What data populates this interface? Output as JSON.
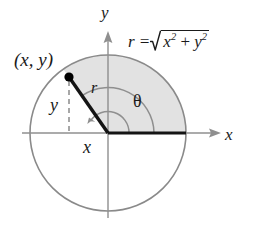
{
  "figure": {
    "labels": {
      "point": "(x, y)",
      "axis_y": "y",
      "axis_x": "x",
      "leg_vertical": "y",
      "leg_horizontal": "x",
      "radius": "r",
      "angle": "θ",
      "formula_lhs": "r =",
      "formula_term1": "x",
      "formula_exp1": "2",
      "formula_plus": "+",
      "formula_term2": "y",
      "formula_exp2": "2"
    },
    "colors": {
      "background": "#ffffff",
      "circle_stroke": "#8a8a8a",
      "axis_stroke": "#8f8f8f",
      "sector_fill": "#e2e2e2",
      "radius_line": "#141414",
      "dashed_line": "#8a8a8a",
      "point_fill": "#000000",
      "text": "#1a1a1a"
    },
    "geometry": {
      "center_x": 108,
      "center_y": 133,
      "circle_radius": 78,
      "point_x": 69,
      "point_y": 77,
      "angle_degrees": 125,
      "arc_small_radius": 21,
      "arc_large_radius": 46
    }
  }
}
